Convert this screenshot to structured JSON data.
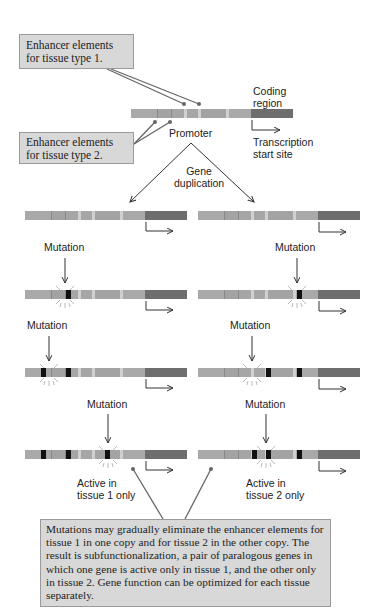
{
  "colors": {
    "enhancer_segment": "#a9a9a9",
    "enhancer_segment_alt": "#9c9c9c",
    "gap": "#cfcfcf",
    "coding_region": "#6e6e6e",
    "mutation": "#111111",
    "callout_bg": "#d8d8d8",
    "line": "#555555"
  },
  "callouts": {
    "tissue1": "Enhancer elements for tissue type 1.",
    "tissue2": "Enhancer elements for tissue type 2.",
    "summary": "Mutations may gradually eliminate the enhancer elements for tissue 1 in one copy and for tissue 2 in the other copy. The result is subfunctionalization, a pair of paralogous genes in which one gene is active only in tissue 1, and the other only in tissue 2. Gene function can be optimized for each tissue separately."
  },
  "labels": {
    "coding_region": "Coding region",
    "promoter": "Promoter",
    "transcription_start": "Transcription start site",
    "gene_duplication": "Gene duplication",
    "mutation": "Mutation",
    "active_tissue1": "Active in tissue 1 only",
    "active_tissue2": "Active in tissue 2 only"
  },
  "rows": [
    {
      "step": "duplicated",
      "left_mutations": [],
      "right_mutations": []
    },
    {
      "step": "mutation-1",
      "left_mutations": [
        1
      ],
      "right_mutations": [
        2
      ]
    },
    {
      "step": "mutation-2",
      "left_mutations": [
        0,
        1
      ],
      "right_mutations": [
        1,
        2
      ]
    },
    {
      "step": "mutation-3",
      "left_mutations": [
        0,
        1,
        2
      ],
      "right_mutations": [
        0,
        1,
        2
      ]
    }
  ]
}
